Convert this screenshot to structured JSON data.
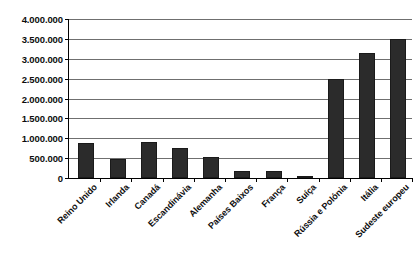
{
  "chart_data": {
    "type": "bar",
    "title": "",
    "subtitle": "",
    "xlabel": "",
    "ylabel": "",
    "ylim": [
      0,
      4000000
    ],
    "ytick_step": 500000,
    "grid": true,
    "legend": false,
    "legend_position": "none",
    "bar_color": "#2b2b2b",
    "axis_color": "#000000",
    "gridline_color": "#6f6f6f",
    "background_color": "#ffffff",
    "number_format": "european-dot-thousands",
    "categories": [
      "Reino Unido",
      "Irlanda",
      "Canadá",
      "Escandinávia",
      "Alemanha",
      "Países Baixos",
      "França",
      "Suíça",
      "Rússia e Polónia",
      "Itália",
      "Sudeste europeu"
    ],
    "values": [
      880000,
      480000,
      900000,
      750000,
      530000,
      180000,
      170000,
      60000,
      2500000,
      3150000,
      3500000
    ],
    "ytick_labels": [
      "0",
      "500.000",
      "1.000.000",
      "1.500.000",
      "2.000.000",
      "2.500.000",
      "3.000.000",
      "3.500.000",
      "4.000.000"
    ],
    "ytick_values": [
      0,
      500000,
      1000000,
      1500000,
      2000000,
      2500000,
      3000000,
      3500000,
      4000000
    ]
  }
}
